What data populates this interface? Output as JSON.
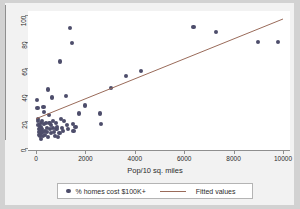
{
  "chart_data": {
    "type": "scatter",
    "title": "",
    "xlabel": "Pop/10 sq. miles",
    "ylabel": "",
    "xlim": [
      0,
      10000
    ],
    "ylim": [
      0,
      100
    ],
    "xticks": [
      0,
      2000,
      4000,
      6000,
      8000,
      10000
    ],
    "xtick_labels": [
      "0",
      "2000",
      "4000",
      "6000",
      "8000",
      "10000"
    ],
    "yticks": [
      0,
      20,
      40,
      60,
      80,
      100
    ],
    "ytick_labels": [
      "0",
      "20",
      "40",
      "60",
      "80",
      "100"
    ],
    "grid": false,
    "legend_position": "bottom-center",
    "series": [
      {
        "name": "% homes cost $100K+",
        "type": "scatter",
        "marker": "circle",
        "color": "#4d4d6b",
        "points": [
          [
            40,
            36
          ],
          [
            60,
            30
          ],
          [
            80,
            22
          ],
          [
            90,
            20
          ],
          [
            100,
            17
          ],
          [
            110,
            14
          ],
          [
            130,
            12
          ],
          [
            140,
            10
          ],
          [
            150,
            9
          ],
          [
            170,
            13
          ],
          [
            180,
            16
          ],
          [
            190,
            19
          ],
          [
            200,
            11
          ],
          [
            210,
            7
          ],
          [
            230,
            14
          ],
          [
            250,
            20
          ],
          [
            260,
            12
          ],
          [
            280,
            9
          ],
          [
            300,
            31
          ],
          [
            320,
            27
          ],
          [
            340,
            18
          ],
          [
            360,
            13
          ],
          [
            380,
            10
          ],
          [
            400,
            19
          ],
          [
            430,
            15
          ],
          [
            450,
            12
          ],
          [
            470,
            8
          ],
          [
            500,
            44
          ],
          [
            520,
            25
          ],
          [
            550,
            19
          ],
          [
            570,
            14
          ],
          [
            600,
            11
          ],
          [
            620,
            17
          ],
          [
            650,
            38
          ],
          [
            680,
            20
          ],
          [
            700,
            15
          ],
          [
            730,
            12
          ],
          [
            760,
            9
          ],
          [
            800,
            19
          ],
          [
            830,
            14
          ],
          [
            860,
            16
          ],
          [
            900,
            8
          ],
          [
            950,
            11
          ],
          [
            980,
            65
          ],
          [
            1000,
            22
          ],
          [
            1050,
            15
          ],
          [
            1100,
            13
          ],
          [
            1150,
            20
          ],
          [
            1200,
            39
          ],
          [
            1250,
            17
          ],
          [
            1300,
            14
          ],
          [
            1380,
            90
          ],
          [
            1450,
            79
          ],
          [
            1500,
            18
          ],
          [
            1520,
            13
          ],
          [
            1600,
            16
          ],
          [
            1750,
            26
          ],
          [
            2000,
            32
          ],
          [
            2600,
            26
          ],
          [
            2620,
            18
          ],
          [
            3050,
            45
          ],
          [
            3650,
            54
          ],
          [
            4250,
            58
          ],
          [
            6380,
            91
          ],
          [
            7300,
            87
          ],
          [
            8980,
            80
          ],
          [
            9800,
            80
          ]
        ]
      },
      {
        "name": "Fitted values",
        "type": "line",
        "color": "#9a6b5a",
        "endpoints": [
          [
            0,
            22
          ],
          [
            10000,
            97
          ]
        ]
      }
    ]
  },
  "legend": {
    "scatter_label": "% homes cost $100K+",
    "line_label": "Fitted values"
  },
  "axes": {
    "x_title": "Pop/10 sq. miles"
  }
}
